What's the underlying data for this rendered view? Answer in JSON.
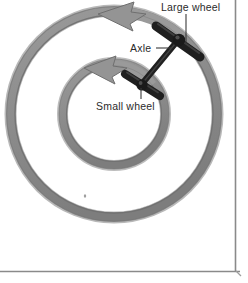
{
  "figure": {
    "kind": "mechanical-diagram",
    "background_color": "#ffffff",
    "border_color": "#8a8a8a",
    "rim_color": "#8c8c8c",
    "rim_shadow_color": "#6f6f6f",
    "arrow_color": "#8c8c8c",
    "hardware_color": "#2a2a2a",
    "label_color": "#2b2b2b",
    "leader_color": "#3a3a3a"
  },
  "labels": {
    "large_wheel": "Large wheel",
    "axle": "Axle",
    "small_wheel": "Small wheel"
  },
  "geometry": {
    "large_wheel": {
      "cx": 114,
      "cy": 114,
      "radius": 103,
      "rim_width": 9
    },
    "small_wheel": {
      "cx": 114,
      "cy": 114,
      "radius": 51,
      "rim_width": 8
    },
    "rotation_direction": "counter-clockwise"
  },
  "icons": {
    "large_wheel_arrow": "arrow-counterclockwise-icon",
    "small_wheel_arrow": "arrow-counterclockwise-icon",
    "axle_rod": "axle-rod-icon",
    "large_wheel_clamp": "clamp-bracket-icon",
    "small_wheel_clamp": "clamp-bracket-icon",
    "speck": "dust-speck-icon"
  }
}
